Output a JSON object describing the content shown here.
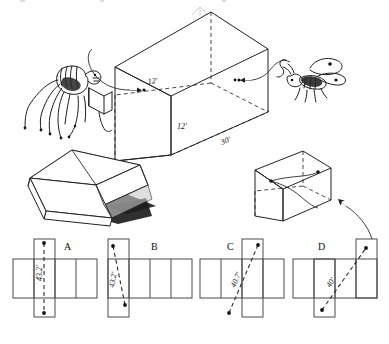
{
  "figure": {
    "ink_color": "#1d1d1d",
    "paper_color": "#ffffff"
  },
  "main_box": {
    "name": "large-open-room-box",
    "dimensions": [
      {
        "label": "12'",
        "edge": "top-front-vertical-left",
        "value": 12,
        "unit": "ft"
      },
      {
        "label": "12'",
        "edge": "front-right-vertical",
        "value": 12,
        "unit": "ft"
      },
      {
        "label": "30'",
        "edge": "bottom-front-horizontal",
        "value": 30,
        "unit": "ft"
      }
    ],
    "spider": {
      "name": "spider",
      "side": "left",
      "marker": "dot"
    },
    "fly": {
      "name": "fly",
      "side": "right",
      "marker": "dot"
    }
  },
  "opened_box": {
    "name": "opened-carton-illustration",
    "caption": ""
  },
  "small_box": {
    "name": "small-box-with-path",
    "caption": ""
  },
  "nets": [
    {
      "id": "A",
      "label": "A",
      "distance": "43.2'",
      "distance_value": 43.2,
      "tab_position": "top-left-upper",
      "path": "vertical"
    },
    {
      "id": "B",
      "label": "B",
      "distance": "43.2'",
      "distance_value": 43.2,
      "tab_position": "left",
      "path": "near-vertical"
    },
    {
      "id": "C",
      "label": "C",
      "distance": "40.7'",
      "distance_value": 40.7,
      "tab_position": "top-middle",
      "path": "diagonal"
    },
    {
      "id": "D",
      "label": "D",
      "distance": "40'",
      "distance_value": 40,
      "tab_position": "top-right",
      "path": "diagonal"
    }
  ]
}
